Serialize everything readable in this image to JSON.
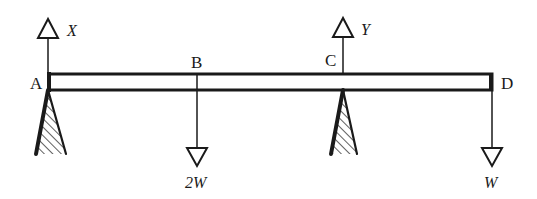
{
  "diagram": {
    "type": "beam-statics",
    "colors": {
      "ink": "#1a1a1a",
      "background": "#ffffff"
    },
    "points": {
      "A": {
        "label": "A",
        "x": 48,
        "support": true
      },
      "B": {
        "label": "B",
        "x": 197,
        "support": false
      },
      "C": {
        "label": "C",
        "x": 343,
        "support": true
      },
      "D": {
        "label": "D",
        "x": 493,
        "support": false
      }
    },
    "forces": {
      "reaction_A": {
        "label": "X",
        "direction": "up",
        "at": "A"
      },
      "reaction_C": {
        "label": "Y",
        "direction": "up",
        "at": "C"
      },
      "load_B": {
        "label": "2W",
        "direction": "down",
        "at": "B"
      },
      "load_D": {
        "label": "W",
        "direction": "down",
        "at": "D"
      }
    }
  }
}
